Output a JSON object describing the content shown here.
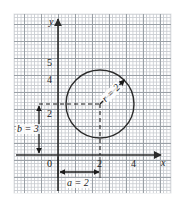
{
  "figure": {
    "axes": {
      "x_label": "x",
      "y_label": "y",
      "x_ticks": [
        {
          "value": 0,
          "label": "0"
        },
        {
          "value": 2,
          "label": "2"
        },
        {
          "value": 4,
          "label": "4"
        }
      ],
      "y_ticks": [
        {
          "value": 2,
          "label": "2"
        },
        {
          "value": 4,
          "label": "4"
        },
        {
          "value": 5,
          "label": "5"
        }
      ],
      "grid": "graph paper, minor squares with major line every 5 squares (1 unit)"
    },
    "annotations": {
      "a_label": "a = 2",
      "b_label": "b = 3",
      "r_label": "r = 2"
    },
    "shape": {
      "name": "circle",
      "center_x": 2,
      "center_y": 3,
      "radius": 2
    },
    "colors": {
      "axis": "#2b2b2b",
      "curve": "#2b2b2b",
      "grid_major": "#9aa0a6",
      "grid_minor": "#c9ccd1",
      "text": "#1a1a1a",
      "background": "#ffffff"
    }
  }
}
